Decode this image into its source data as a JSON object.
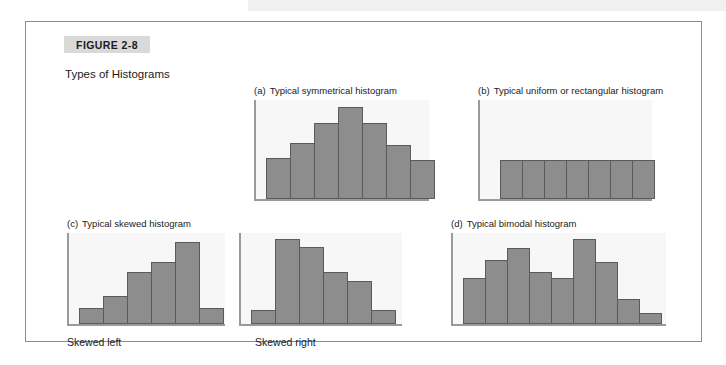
{
  "figure": {
    "label": "FIGURE 2-8",
    "caption": "Types of Histograms",
    "label_bg": "#d9d9d9",
    "frame_color": "#8c8c8c"
  },
  "colors": {
    "bar_fill": "#8d8d8d",
    "bar_stroke": "#5a5a5a",
    "plot_bg": "#f7f7f7",
    "axis": "#9a9a9a",
    "text": "#1c1c1c"
  },
  "panels": {
    "a": {
      "marker": "(a)",
      "title": "Typical symmetrical histogram"
    },
    "b": {
      "marker": "(b)",
      "title": "Typical uniform or rectangular histogram"
    },
    "c": {
      "marker": "(c)",
      "title": "Typical skewed histogram",
      "sublabel_left": "Skewed left",
      "sublabel_right": "Skewed right"
    },
    "d": {
      "marker": "(d)",
      "title": "Typical bimodal histogram"
    }
  },
  "chart_data": [
    {
      "id": "a",
      "type": "bar",
      "title": "Typical symmetrical histogram",
      "xlabel": "",
      "ylabel": "",
      "grid": false,
      "legend": "none",
      "ylim": [
        0,
        100
      ],
      "categories": [
        "1",
        "2",
        "3",
        "4",
        "5",
        "6",
        "7"
      ],
      "values": [
        42,
        58,
        78,
        95,
        78,
        56,
        40
      ],
      "bar_width_px": 25
    },
    {
      "id": "b",
      "type": "bar",
      "title": "Typical uniform or rectangular histogram",
      "xlabel": "",
      "ylabel": "",
      "grid": false,
      "legend": "none",
      "ylim": [
        0,
        100
      ],
      "categories": [
        "1",
        "2",
        "3",
        "4",
        "5",
        "6",
        "7"
      ],
      "values": [
        40,
        40,
        40,
        40,
        40,
        40,
        40
      ],
      "bar_width_px": 23
    },
    {
      "id": "c-left",
      "type": "bar",
      "title": "Skewed left",
      "xlabel": "",
      "ylabel": "",
      "grid": false,
      "legend": "none",
      "ylim": [
        0,
        100
      ],
      "categories": [
        "1",
        "2",
        "3",
        "4",
        "5",
        "6"
      ],
      "values": [
        18,
        32,
        58,
        70,
        92,
        18
      ],
      "bar_width_px": 25
    },
    {
      "id": "c-right",
      "type": "bar",
      "title": "Skewed right",
      "xlabel": "",
      "ylabel": "",
      "grid": false,
      "legend": "none",
      "ylim": [
        0,
        100
      ],
      "categories": [
        "1",
        "2",
        "3",
        "4",
        "5",
        "6"
      ],
      "values": [
        16,
        95,
        86,
        58,
        48,
        16
      ],
      "bar_width_px": 25
    },
    {
      "id": "d",
      "type": "bar",
      "title": "Typical bimodal histogram",
      "xlabel": "",
      "ylabel": "",
      "grid": false,
      "legend": "none",
      "ylim": [
        0,
        100
      ],
      "categories": [
        "1",
        "2",
        "3",
        "4",
        "5",
        "6",
        "7",
        "8",
        "9"
      ],
      "values": [
        52,
        72,
        85,
        58,
        52,
        95,
        70,
        28,
        12
      ],
      "bar_width_px": 23
    }
  ]
}
